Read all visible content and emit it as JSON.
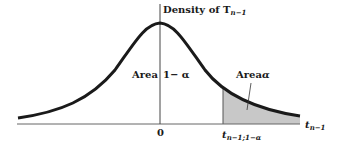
{
  "diagram": {
    "title": "Density of T",
    "title_subscript": "n−1",
    "y_axis_label": "Density of T_{n-1}",
    "x_axis_label": "t",
    "x_axis_label_subscript": "n−1",
    "origin_label": "0",
    "critical_value_label": "t",
    "critical_value_subscript": "n−1;1−α",
    "area_left_label": "Area",
    "area_left_value": "1− α",
    "area_right_label": "Area",
    "area_right_value": "α",
    "colors": {
      "curve": "#1a1a1a",
      "axis": "#555555",
      "shade": "#c8c8c8",
      "background": "#ffffff"
    }
  }
}
